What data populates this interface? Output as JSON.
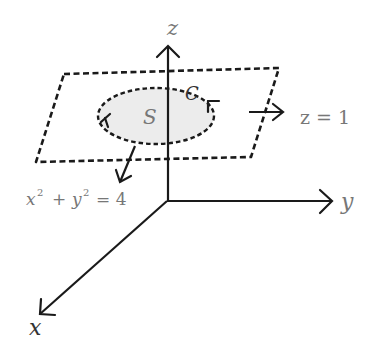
{
  "diagram": {
    "type": "3d-coordinate-surface",
    "colors": {
      "stroke": "#1a1a1a",
      "label": "#777777",
      "surface_fill": "#ececec",
      "background": "#ffffff"
    },
    "axes": {
      "z_label": "z",
      "y_label": "y",
      "x_label": "x"
    },
    "labels": {
      "plane": "z = 1",
      "circle_eq_x": "x",
      "circle_eq_exp1": "2",
      "circle_eq_plus": "+",
      "circle_eq_y": "y",
      "circle_eq_exp2": "2",
      "circle_eq_rhs": "= 4",
      "surface": "S",
      "curve": "C"
    }
  }
}
